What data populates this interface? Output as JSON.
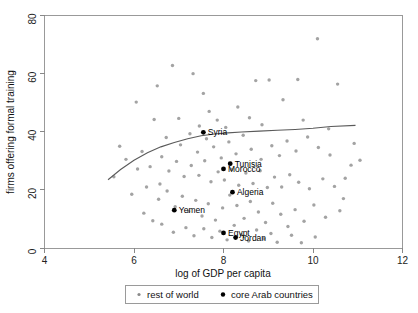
{
  "chart_data": {
    "type": "scatter",
    "title": "",
    "xlabel": "log of GDP per capita",
    "ylabel": "firms offering formal training",
    "xlim": [
      4,
      12
    ],
    "ylim": [
      0,
      80
    ],
    "xticks": [
      4,
      6,
      8,
      10,
      12
    ],
    "yticks": [
      0,
      20,
      40,
      60,
      80
    ],
    "grid": false,
    "legend_position": "below-axis",
    "colors": {
      "rest_of_world": "#808080",
      "core_arab": "#000000",
      "fit_line": "#5a5a5a",
      "axis": "#888888"
    },
    "series": [
      {
        "name": "rest of world",
        "marker": "small-gray-dot",
        "color": "#808080",
        "points": [
          [
            6.05,
            50.2
          ],
          [
            6.52,
            55.8
          ],
          [
            6.86,
            62.8
          ],
          [
            7.32,
            60.0
          ],
          [
            7.55,
            53.2
          ],
          [
            7.68,
            47.0
          ],
          [
            7.86,
            44.0
          ],
          [
            8.05,
            41.5
          ],
          [
            8.32,
            48.5
          ],
          [
            8.58,
            44.8
          ],
          [
            8.72,
            57.6
          ],
          [
            9.02,
            57.8
          ],
          [
            9.33,
            51.0
          ],
          [
            9.66,
            58.0
          ],
          [
            10.1,
            72.0
          ],
          [
            10.55,
            56.4
          ],
          [
            6.45,
            44.2
          ],
          [
            6.72,
            38.0
          ],
          [
            7.04,
            35.5
          ],
          [
            7.25,
            39.3
          ],
          [
            7.42,
            33.0
          ],
          [
            7.62,
            37.6
          ],
          [
            7.78,
            34.8
          ],
          [
            7.95,
            31.0
          ],
          [
            8.12,
            36.5
          ],
          [
            8.28,
            32.4
          ],
          [
            8.44,
            38.8
          ],
          [
            8.62,
            34.0
          ],
          [
            8.84,
            30.5
          ],
          [
            9.08,
            35.2
          ],
          [
            9.25,
            31.8
          ],
          [
            9.42,
            36.8
          ],
          [
            9.62,
            33.4
          ],
          [
            9.88,
            38.2
          ],
          [
            10.12,
            34.6
          ],
          [
            10.38,
            32.0
          ],
          [
            5.82,
            30.5
          ],
          [
            6.18,
            33.2
          ],
          [
            6.36,
            28.0
          ],
          [
            6.62,
            31.4
          ],
          [
            6.78,
            26.5
          ],
          [
            6.95,
            29.8
          ],
          [
            7.12,
            24.6
          ],
          [
            7.28,
            28.4
          ],
          [
            7.45,
            25.0
          ],
          [
            7.58,
            30.0
          ],
          [
            7.72,
            22.8
          ],
          [
            7.88,
            26.2
          ],
          [
            8.02,
            23.4
          ],
          [
            8.18,
            27.0
          ],
          [
            8.34,
            21.6
          ],
          [
            8.5,
            25.8
          ],
          [
            8.66,
            22.2
          ],
          [
            8.82,
            26.6
          ],
          [
            8.98,
            20.8
          ],
          [
            9.14,
            24.4
          ],
          [
            9.3,
            21.0
          ],
          [
            9.48,
            25.2
          ],
          [
            9.68,
            22.6
          ],
          [
            9.92,
            20.4
          ],
          [
            10.22,
            23.8
          ],
          [
            10.48,
            21.2
          ],
          [
            10.72,
            24.0
          ],
          [
            5.95,
            18.5
          ],
          [
            6.28,
            21.0
          ],
          [
            6.55,
            16.8
          ],
          [
            6.74,
            19.6
          ],
          [
            6.92,
            14.2
          ],
          [
            7.08,
            17.8
          ],
          [
            7.22,
            12.6
          ],
          [
            7.38,
            16.4
          ],
          [
            7.52,
            11.0
          ],
          [
            7.66,
            15.2
          ],
          [
            7.82,
            9.6
          ],
          [
            7.98,
            13.8
          ],
          [
            8.14,
            18.2
          ],
          [
            8.3,
            14.6
          ],
          [
            8.46,
            10.2
          ],
          [
            8.6,
            16.0
          ],
          [
            8.78,
            12.4
          ],
          [
            8.94,
            8.8
          ],
          [
            9.1,
            15.4
          ],
          [
            9.28,
            11.6
          ],
          [
            9.44,
            7.4
          ],
          [
            9.6,
            13.2
          ],
          [
            9.8,
            9.2
          ],
          [
            10.02,
            14.8
          ],
          [
            10.28,
            10.6
          ],
          [
            10.6,
            12.8
          ],
          [
            6.62,
            8.2
          ],
          [
            6.88,
            5.4
          ],
          [
            7.16,
            7.0
          ],
          [
            7.34,
            4.2
          ],
          [
            7.56,
            6.6
          ],
          [
            7.74,
            3.6
          ],
          [
            7.92,
            5.8
          ],
          [
            8.08,
            2.8
          ],
          [
            8.24,
            7.8
          ],
          [
            8.4,
            4.6
          ],
          [
            8.56,
            2.4
          ],
          [
            8.74,
            6.2
          ],
          [
            8.9,
            3.2
          ],
          [
            9.06,
            5.0
          ],
          [
            9.2,
            2.0
          ],
          [
            9.52,
            4.4
          ],
          [
            9.74,
            1.8
          ],
          [
            10.05,
            3.8
          ],
          [
            5.55,
            24.5
          ],
          [
            5.68,
            35.0
          ],
          [
            6.08,
            27.2
          ],
          [
            6.22,
            12.0
          ],
          [
            6.42,
            9.4
          ],
          [
            6.58,
            22.0
          ],
          [
            7.0,
            44.6
          ],
          [
            7.46,
            42.0
          ],
          [
            8.86,
            42.4
          ],
          [
            9.78,
            44.0
          ],
          [
            10.35,
            41.0
          ],
          [
            10.85,
            28.5
          ],
          [
            10.68,
            17.0
          ],
          [
            10.92,
            36.0
          ],
          [
            11.05,
            30.2
          ]
        ]
      },
      {
        "name": "core Arab countries",
        "marker": "black-dot",
        "color": "#000000",
        "points": [
          {
            "label": "Syria",
            "x": 7.55,
            "y": 39.8,
            "label_side": "right"
          },
          {
            "label": "Tunisia",
            "x": 8.15,
            "y": 29.0,
            "label_side": "right"
          },
          {
            "label": "Morocco",
            "x": 8.0,
            "y": 27.2,
            "label_side": "right"
          },
          {
            "label": "Algeria",
            "x": 8.2,
            "y": 19.2,
            "label_side": "right"
          },
          {
            "label": "Yemen",
            "x": 6.9,
            "y": 13.0,
            "label_side": "right"
          },
          {
            "label": "Egypt",
            "x": 8.0,
            "y": 5.2,
            "label_side": "right"
          },
          {
            "label": "Jordan",
            "x": 8.27,
            "y": 3.6,
            "label_side": "right"
          }
        ]
      }
    ],
    "fit_line": {
      "name": "lowess fit",
      "points": [
        [
          5.42,
          23.5
        ],
        [
          5.7,
          27.0
        ],
        [
          6.0,
          30.2
        ],
        [
          6.3,
          32.8
        ],
        [
          6.6,
          34.8
        ],
        [
          6.9,
          36.3
        ],
        [
          7.2,
          37.6
        ],
        [
          7.5,
          38.6
        ],
        [
          7.8,
          39.2
        ],
        [
          8.1,
          39.6
        ],
        [
          8.4,
          39.9
        ],
        [
          8.8,
          40.2
        ],
        [
          9.2,
          40.5
        ],
        [
          9.6,
          40.8
        ],
        [
          10.0,
          41.2
        ],
        [
          10.4,
          41.8
        ],
        [
          10.95,
          42.2
        ]
      ]
    },
    "legend": {
      "entries": [
        {
          "label": "rest of world",
          "marker": "small-gray-dot",
          "color": "#808080"
        },
        {
          "label": "core Arab countries",
          "marker": "black-dot",
          "color": "#000000"
        }
      ]
    }
  }
}
